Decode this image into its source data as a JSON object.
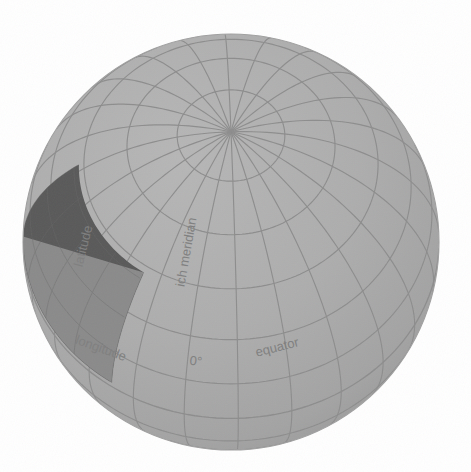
{
  "figure": {
    "kind": "globe-graticule-diagram",
    "background_color": "#ffffff",
    "caption_present": false
  },
  "globe": {
    "name": "sphere-globe",
    "center_x": 231,
    "center_y": 242,
    "radius": 208,
    "surface_color": "#ababab",
    "surface_shadow_color": "#9d9d9d",
    "graticule_color": "#8d8d8d",
    "outline_color": "#a0a0a0",
    "pole_x": 237,
    "pole_y": 56,
    "graticule": {
      "meridian_step_degrees": 15,
      "parallel_step_degrees": 15,
      "visible_pole": "north"
    }
  },
  "highlight_patch": {
    "name": "spherical-quadrilateral-patch",
    "dark_face_color": "#595959",
    "light_face_color": "#8a8a8a",
    "edge_color": "#4f4f4f",
    "description": "shaded spherical quadrangle bounded by two meridians and two parallels"
  },
  "labels": {
    "latitude": {
      "text": "latitude",
      "color": "#7f7f7f",
      "font_size_px": 13,
      "rotation_deg": -76,
      "x": 83,
      "y": 246
    },
    "longitude": {
      "text": "longitude",
      "color": "#7f7f7f",
      "font_size_px": 13,
      "rotation_deg": 20,
      "x": 101,
      "y": 348
    },
    "longitude_value": {
      "text": "0°",
      "color": "#7f7f7f",
      "font_size_px": 13,
      "rotation_deg": 6,
      "x": 196,
      "y": 361
    },
    "greenwich_meridian": {
      "text": "Greenwich meridian",
      "visible_text": "ich meridian",
      "color": "#7f7f7f",
      "font_size_px": 13,
      "rotation_deg": -80,
      "x": 186,
      "y": 252
    },
    "equator": {
      "text": "equator",
      "color": "#7f7f7f",
      "font_size_px": 13,
      "rotation_deg": -14,
      "x": 277,
      "y": 347
    }
  }
}
